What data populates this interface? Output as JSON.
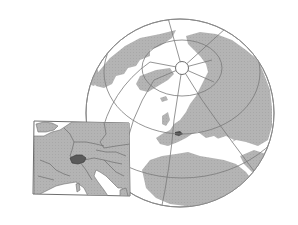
{
  "map": {
    "type": "locator-map",
    "projection": "orthographic globe",
    "highlighted_region": "Switzerland",
    "globe": {
      "view": "Northern hemisphere with North Pole, Europe and Africa",
      "center": [
        180,
        113
      ],
      "radius": 94
    },
    "inset": {
      "view": "Central Europe detail",
      "bounds": [
        33,
        120,
        130,
        196
      ]
    },
    "colors": {
      "background": "#ffffff",
      "ocean": "#ffffff",
      "land": "#b4b4b4",
      "border": "#6e6e6e",
      "graticule": "#7a7a7a",
      "highlight": "#5a5a5a",
      "outline": "#8a8a8a"
    }
  }
}
